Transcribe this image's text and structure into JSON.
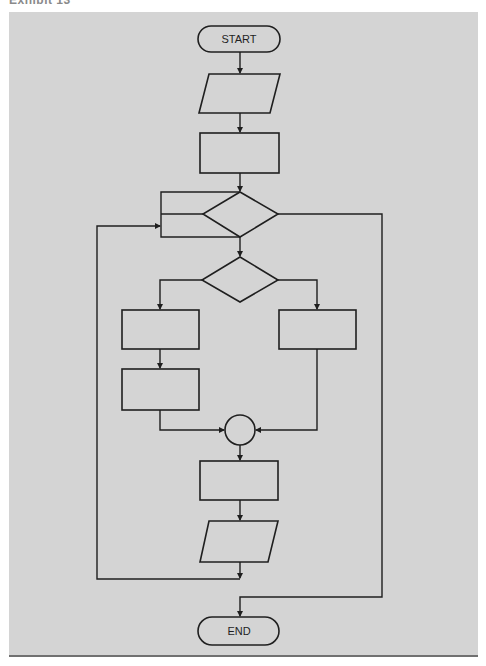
{
  "caption": "Exhibit 13",
  "colors": {
    "panel_background": "#d4d4d4",
    "stroke": "#1f1f1f",
    "bottom_rule": "#707070",
    "page_background": "#ffffff"
  },
  "flowchart": {
    "nodes": [
      {
        "id": "start",
        "type": "terminal",
        "label": "START"
      },
      {
        "id": "input1",
        "type": "input-output",
        "label": ""
      },
      {
        "id": "process1",
        "type": "process",
        "label": ""
      },
      {
        "id": "loop-decision",
        "type": "decision",
        "label": ""
      },
      {
        "id": "branch-decision",
        "type": "decision",
        "label": ""
      },
      {
        "id": "process-left-1",
        "type": "process",
        "label": ""
      },
      {
        "id": "process-left-2",
        "type": "process",
        "label": ""
      },
      {
        "id": "process-right",
        "type": "process",
        "label": ""
      },
      {
        "id": "connector",
        "type": "connector",
        "label": ""
      },
      {
        "id": "process-final",
        "type": "process",
        "label": ""
      },
      {
        "id": "output1",
        "type": "input-output",
        "label": ""
      },
      {
        "id": "end",
        "type": "terminal",
        "label": "END"
      }
    ],
    "edges": [
      {
        "from": "start",
        "to": "input1"
      },
      {
        "from": "input1",
        "to": "process1"
      },
      {
        "from": "process1",
        "to": "loop-decision"
      },
      {
        "from": "loop-decision",
        "to": "branch-decision"
      },
      {
        "from": "loop-decision",
        "to": "end",
        "note": "exit path on right"
      },
      {
        "from": "branch-decision",
        "to": "process-left-1"
      },
      {
        "from": "branch-decision",
        "to": "process-right"
      },
      {
        "from": "process-left-1",
        "to": "process-left-2"
      },
      {
        "from": "process-left-2",
        "to": "connector"
      },
      {
        "from": "process-right",
        "to": "connector"
      },
      {
        "from": "connector",
        "to": "process-final"
      },
      {
        "from": "process-final",
        "to": "output1"
      },
      {
        "from": "output1",
        "to": "loop-decision",
        "note": "loop back on left"
      }
    ]
  }
}
